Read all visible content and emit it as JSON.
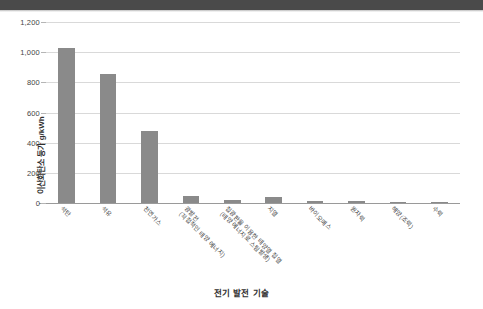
{
  "figure": {
    "header_strip_color": "#4a4a4a",
    "background": "#ffffff"
  },
  "chart_data": {
    "type": "bar",
    "title": "",
    "xlabel": "전기 발전 기술",
    "ylabel": "이산화탄소 등가 g/kWh",
    "ylim": [
      0,
      1200
    ],
    "yticks": [
      0,
      200,
      400,
      600,
      800,
      1000,
      1200
    ],
    "ytick_labels": [
      "0",
      "200",
      "400",
      "600",
      "800",
      "1,000",
      "1,200"
    ],
    "grid": true,
    "legend": "none",
    "bar_color": "#8a8a8a",
    "categories": [
      "석탄",
      "석유",
      "천연가스",
      "광발전\n(직접적인 태양 에너지)",
      "집광판을 이용한 태양열 집열\n(태양 에너지로 스팀발생)",
      "지열",
      "바이오매스",
      "원자력",
      "해양(조력)",
      "수력"
    ],
    "category_lines": [
      [
        "석탄"
      ],
      [
        "석유"
      ],
      [
        "천연가스"
      ],
      [
        "광발전",
        "(직접적인 태양 에너지)"
      ],
      [
        "집광판을 이용한 태양열 집열",
        "(태양 에너지로 스팀발생)"
      ],
      [
        "지열"
      ],
      [
        "바이오매스"
      ],
      [
        "원자력"
      ],
      [
        "해양(조력)"
      ],
      [
        "수력"
      ]
    ],
    "values": [
      1025,
      855,
      475,
      46,
      20,
      42,
      16,
      12,
      4,
      4
    ]
  }
}
